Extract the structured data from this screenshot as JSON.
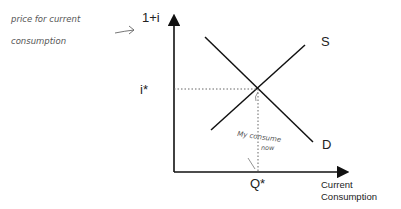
{
  "diagram": {
    "y_axis_label": "1+i",
    "x_axis_label_line1": "Current",
    "x_axis_label_line2": "Consumption",
    "supply_label": "S",
    "demand_label": "D",
    "equilibrium_price_label": "i*",
    "equilibrium_quantity_label": "Q*",
    "annotation_price_line1": "price for current",
    "annotation_price_line2": "consumption",
    "annotation_equilibrium_line1": "My consume",
    "annotation_equilibrium_line2": "now",
    "colors": {
      "axis": "#111111",
      "curves": "#111111",
      "handwriting": "#555555",
      "dotted": "#666666"
    }
  }
}
